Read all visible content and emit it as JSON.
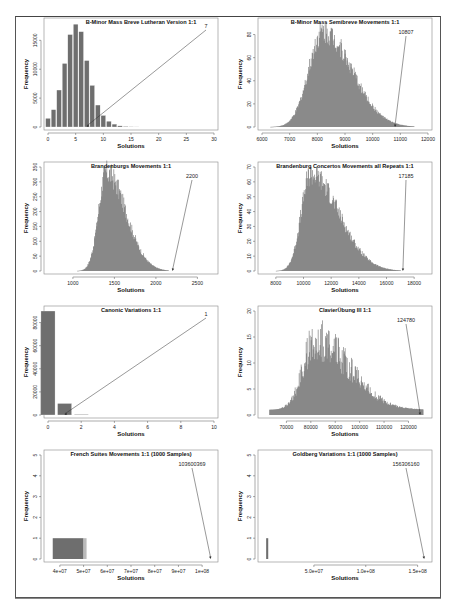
{
  "figure": {
    "panel_count": 8,
    "bar_color": "#6e6e6e",
    "axis_color": "#555555",
    "annotation_line_color": "#333333"
  },
  "chart_data": [
    {
      "type": "bar",
      "title": "B-Minor Mass Breve Lutheran Version 1:1",
      "xlabel": "Solutions",
      "ylabel": "Frequency",
      "categories": [
        0,
        1,
        2,
        3,
        4,
        5,
        6,
        7,
        8,
        9,
        10,
        11,
        12,
        13,
        14,
        15,
        16
      ],
      "values": [
        1500,
        3000,
        6400,
        11000,
        16000,
        17800,
        16500,
        11500,
        7200,
        3800,
        2000,
        1000,
        500,
        200,
        100,
        50,
        20
      ],
      "xlim": [
        0,
        30
      ],
      "xticks": [
        "0",
        "5",
        "10",
        "15",
        "20",
        "25",
        "30"
      ],
      "ylim": [
        0,
        18000
      ],
      "yticks": [
        "0",
        "5000",
        "10000",
        "15000"
      ],
      "annotation": {
        "label": "7",
        "x": 7
      }
    },
    {
      "type": "bar",
      "title": "B-Minor Mass Semibreve Movements 1:1",
      "xlabel": "Solutions",
      "ylabel": "Frequency",
      "distribution": {
        "mode": 8200,
        "peak": 85,
        "min": 6300,
        "max": 11500
      },
      "xlim": [
        6000,
        12000
      ],
      "xticks": [
        "6000",
        "7000",
        "8000",
        "9000",
        "10000",
        "11000",
        "12000"
      ],
      "ylim": [
        0,
        90
      ],
      "yticks": [
        "0",
        "20",
        "40",
        "60",
        "80"
      ],
      "annotation": {
        "label": "10807",
        "x": 10807
      }
    },
    {
      "type": "bar",
      "title": "Brandenburgs Movements 1:1",
      "xlabel": "Solutions",
      "ylabel": "Frequency",
      "distribution": {
        "mode": 1400,
        "peak": 340,
        "min": 1050,
        "max": 2150
      },
      "xlim": [
        700,
        2700
      ],
      "xticks": [
        "1000",
        "1500",
        "2000",
        "2500"
      ],
      "ylim": [
        0,
        350
      ],
      "yticks": [
        "0",
        "50",
        "100",
        "150",
        "200",
        "250",
        "300",
        "350"
      ],
      "annotation": {
        "label": "2200",
        "x": 2200
      }
    },
    {
      "type": "bar",
      "title": "Brandenburg Concertos Movements all Repeats 1:1",
      "xlabel": "Solutions",
      "ylabel": "Frequency",
      "distribution": {
        "mode": 10500,
        "peak": 67,
        "min": 8000,
        "max": 17000
      },
      "xlim": [
        7000,
        19000
      ],
      "xticks": [
        "8000",
        "10000",
        "12000",
        "14000",
        "16000",
        "18000"
      ],
      "ylim": [
        0,
        70
      ],
      "yticks": [
        "0",
        "10",
        "20",
        "30",
        "40",
        "50",
        "60",
        "70"
      ],
      "annotation": {
        "label": "17185",
        "x": 17185
      }
    },
    {
      "type": "bar",
      "title": "Canonic Variations 1:1",
      "xlabel": "Solutions",
      "ylabel": "Frequency",
      "categories": [
        0,
        1,
        2
      ],
      "values": [
        90000,
        10000,
        500
      ],
      "xlim": [
        0,
        10
      ],
      "xticks": [
        "0",
        "2",
        "4",
        "6",
        "8",
        "10"
      ],
      "ylim": [
        0,
        90000
      ],
      "yticks": [
        "0",
        "20000",
        "40000",
        "60000",
        "80000"
      ],
      "annotation": {
        "label": "1",
        "x": 1
      }
    },
    {
      "type": "bar",
      "title": "ClavierÜbung III 1:1",
      "xlabel": "Solutions",
      "ylabel": "Frequency",
      "distribution": {
        "mode": 82000,
        "peak": 17,
        "min": 63000,
        "max": 126000
      },
      "xlim": [
        60000,
        128000
      ],
      "xticks": [
        "70000",
        "80000",
        "90000",
        "100000",
        "110000",
        "120000"
      ],
      "ylim": [
        0,
        20
      ],
      "yticks": [
        "0",
        "5",
        "10",
        "15",
        "20"
      ],
      "annotation": {
        "label": "124780",
        "x": 124780
      }
    },
    {
      "type": "bar",
      "title": "French Suites Movements 1:1 (1000 Samples)",
      "xlabel": "Solutions",
      "ylabel": "Frequency",
      "distribution": {
        "range": [
          37000000,
          50000000
        ],
        "height": 1
      },
      "xlim": [
        35000000,
        105000000
      ],
      "xticks": [
        "4e+07",
        "5e+07",
        "6e+07",
        "7e+07",
        "8e+07",
        "9e+07",
        "1e+08"
      ],
      "ylim": [
        0,
        5
      ],
      "yticks": [
        "0",
        "1",
        "2",
        "3",
        "4",
        "5"
      ],
      "annotation": {
        "label": "103600369",
        "x": 103600369
      }
    },
    {
      "type": "bar",
      "title": "Goldberg Variations 1:1 (1000 Samples)",
      "xlabel": "Solutions",
      "ylabel": "Frequency",
      "distribution": {
        "range": [
          4000000,
          6000000
        ],
        "height": 1
      },
      "xlim": [
        0,
        160000000
      ],
      "xticks": [
        "5.0e+07",
        "1.0e+08",
        "1.5e+08"
      ],
      "ylim": [
        0,
        5
      ],
      "yticks": [
        "0",
        "1",
        "2",
        "3",
        "4",
        "5"
      ],
      "annotation": {
        "label": "156306160",
        "x": 156306160
      }
    }
  ]
}
